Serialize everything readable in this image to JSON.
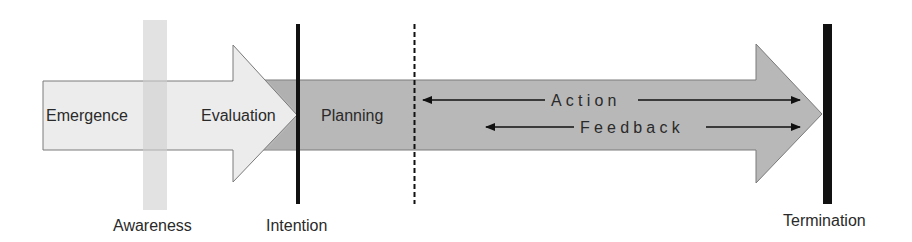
{
  "diagram": {
    "type": "process-timeline",
    "phases": [
      {
        "id": "emergence",
        "label": "Emergence"
      },
      {
        "id": "evaluation",
        "label": "Evaluation"
      },
      {
        "id": "planning",
        "label": "Planning"
      }
    ],
    "flows": [
      {
        "id": "action",
        "label": "Action",
        "direction": "bidirectional"
      },
      {
        "id": "feedback",
        "label": "Feedback",
        "direction": "bidirectional"
      }
    ],
    "milestones": [
      {
        "id": "awareness",
        "label": "Awareness",
        "style": "light-band"
      },
      {
        "id": "intention",
        "label": "Intention",
        "style": "solid-line"
      },
      {
        "id": "action-start",
        "label": "",
        "style": "dashed-line"
      },
      {
        "id": "termination",
        "label": "Termination",
        "style": "thick-solid-line"
      }
    ],
    "colors": {
      "light_arrow_fill": "#ececec",
      "dark_arrow_fill": "#b8b8b8",
      "overlap_fill": "#a9a9a9",
      "awareness_band": "#d6d6d6",
      "outline": "#7a7a7a",
      "line": "#111111",
      "text": "#2a2a2a"
    }
  }
}
